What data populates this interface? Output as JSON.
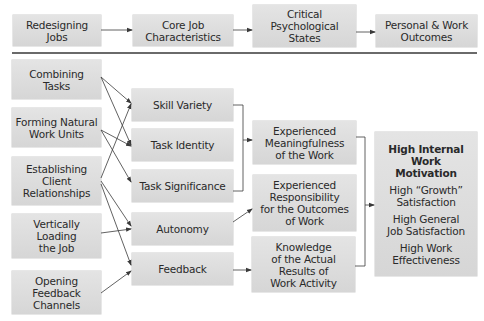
{
  "header_row": {
    "redesigning_jobs": [
      "Redesigning",
      "Jobs"
    ],
    "core_job_characteristics": [
      "Core Job",
      "Characteristics"
    ],
    "critical_psychological_states": [
      "Critical",
      "Psychological",
      "States"
    ],
    "personal_work_outcomes": [
      "Personal & Work",
      "Outcomes"
    ]
  },
  "redesign_actions": [
    {
      "lines": [
        "Combining",
        "Tasks"
      ]
    },
    {
      "lines": [
        "Forming Natural",
        "Work Units"
      ]
    },
    {
      "lines": [
        "Establishing",
        "Client",
        "Relationships"
      ]
    },
    {
      "lines": [
        "Vertically",
        "Loading",
        "the Job"
      ]
    },
    {
      "lines": [
        "Opening",
        "Feedback",
        "Channels"
      ]
    }
  ],
  "core_characteristics": [
    {
      "label": "Skill Variety"
    },
    {
      "label": "Task Identity"
    },
    {
      "label": "Task Significance"
    },
    {
      "label": "Autonomy"
    },
    {
      "label": "Feedback"
    }
  ],
  "psychological_states": [
    {
      "lines": [
        "Experienced",
        "Meaningfulness",
        "of the Work"
      ]
    },
    {
      "lines": [
        "Experienced",
        "Responsibility",
        "for the Outcomes",
        "of Work"
      ]
    },
    {
      "lines": [
        "Knowledge",
        "of the Actual",
        "Results of",
        "Work Activity"
      ]
    }
  ],
  "outcomes": {
    "title": [
      "High Internal",
      "Work",
      "Motivation"
    ],
    "items": [
      [
        "High “Growth”",
        "Satisfaction"
      ],
      [
        "High General",
        "Job Satisfaction"
      ],
      [
        "High Work",
        "Effectiveness"
      ]
    ]
  },
  "connections": [
    {
      "from": "Combining Tasks",
      "to": "Skill Variety"
    },
    {
      "from": "Combining Tasks",
      "to": "Task Identity"
    },
    {
      "from": "Forming Natural Work Units",
      "to": "Task Identity"
    },
    {
      "from": "Forming Natural Work Units",
      "to": "Task Significance"
    },
    {
      "from": "Establishing Client Relationships",
      "to": "Skill Variety"
    },
    {
      "from": "Establishing Client Relationships",
      "to": "Autonomy"
    },
    {
      "from": "Establishing Client Relationships",
      "to": "Feedback"
    },
    {
      "from": "Vertically Loading the Job",
      "to": "Autonomy"
    },
    {
      "from": "Opening Feedback Channels",
      "to": "Feedback"
    },
    {
      "from": "Skill Variety + Task Identity + Task Significance",
      "to": "Experienced Meaningfulness of the Work"
    },
    {
      "from": "Autonomy",
      "to": "Experienced Responsibility for the Outcomes of Work"
    },
    {
      "from": "Feedback",
      "to": "Knowledge of the Actual Results of Work Activity"
    },
    {
      "from": "All Psychological States",
      "to": "Outcomes"
    }
  ],
  "colors": {
    "box_fill": "#dcdcdc",
    "line": "#3a3a3a",
    "divider": "#6a6a6a"
  }
}
